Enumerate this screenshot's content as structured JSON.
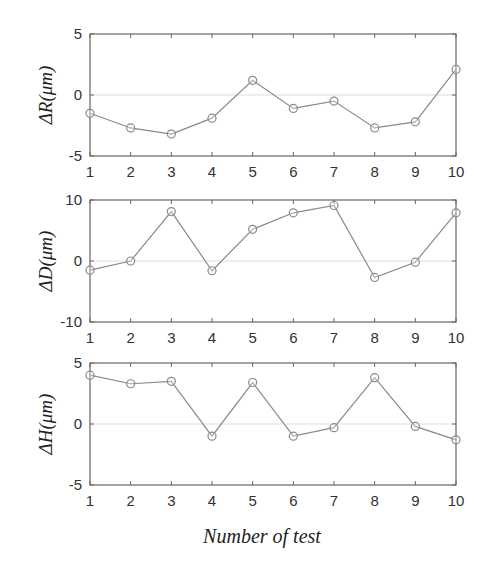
{
  "chart_data": [
    {
      "type": "line",
      "title": "",
      "xlabel": "",
      "ylabel": "ΔR(μm)",
      "x": [
        1,
        2,
        3,
        4,
        5,
        6,
        7,
        8,
        9,
        10
      ],
      "values": [
        -1.5,
        -2.7,
        -3.2,
        -1.9,
        1.2,
        -1.1,
        -0.5,
        -2.7,
        -2.2,
        2.1
      ],
      "ylim": [
        -5,
        5
      ],
      "yticks": [
        "5",
        "0",
        "-5"
      ],
      "ytick_values": [
        5,
        0,
        -5
      ],
      "xticks": [
        "1",
        "2",
        "3",
        "4",
        "5",
        "6",
        "7",
        "8",
        "9",
        "10"
      ],
      "zero_gridline": true,
      "marker": "circle"
    },
    {
      "type": "line",
      "title": "",
      "xlabel": "",
      "ylabel": "ΔD(μm)",
      "x": [
        1,
        2,
        3,
        4,
        5,
        6,
        7,
        8,
        9,
        10
      ],
      "values": [
        -1.5,
        0,
        8.1,
        -1.6,
        5.2,
        7.9,
        9.1,
        -2.7,
        -0.2,
        7.9
      ],
      "ylim": [
        -10,
        10
      ],
      "yticks": [
        "10",
        "0",
        "-10"
      ],
      "ytick_values": [
        10,
        0,
        -10
      ],
      "xticks": [
        "1",
        "2",
        "3",
        "4",
        "5",
        "6",
        "7",
        "8",
        "9",
        "10"
      ],
      "zero_gridline": true,
      "marker": "circle"
    },
    {
      "type": "line",
      "title": "",
      "xlabel": "Number of test",
      "ylabel": "ΔH(μm)",
      "x": [
        1,
        2,
        3,
        4,
        5,
        6,
        7,
        8,
        9,
        10
      ],
      "values": [
        4.0,
        3.3,
        3.5,
        -1.0,
        3.4,
        -1.0,
        -0.3,
        3.8,
        -0.2,
        -1.3
      ],
      "ylim": [
        -5,
        5
      ],
      "yticks": [
        "5",
        "0",
        "-5"
      ],
      "ytick_values": [
        5,
        0,
        -5
      ],
      "xticks": [
        "1",
        "2",
        "3",
        "4",
        "5",
        "6",
        "7",
        "8",
        "9",
        "10"
      ],
      "zero_gridline": true,
      "marker": "circle"
    }
  ],
  "figure": {
    "xtitle": "Number of test",
    "line_color": "#8a8a8a",
    "axis_color": "#666666",
    "grid_color": "#dddddd"
  }
}
